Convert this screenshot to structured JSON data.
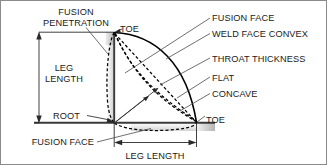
{
  "diagram": {
    "type": "engineering-line-drawing",
    "background_color": "#ffffff",
    "line_color": "#000000",
    "leader_color": "#4a4a4a",
    "shade_color": "#c3c3c3",
    "labels": {
      "fusion_penetration_line1": "FUSION",
      "fusion_penetration_line2": "PENETRATION",
      "leg_length_left_line1": "LEG",
      "leg_length_left_line2": "LENGTH",
      "root": "ROOT",
      "toe_top": "TOE",
      "toe_right": "TOE",
      "fusion_face_right": "FUSION FACE",
      "weld_face_convex": "WELD FACE CONVEX",
      "throat_thickness": "THROAT THICKNESS",
      "flat": "FLAT",
      "concave": "CONCAVE",
      "fusion_face_bottom": "FUSION FACE",
      "leg_length_bottom": "LEG LENGTH"
    },
    "dimensions": [
      {
        "name": "leg-length-vertical",
        "label": "LEG LENGTH",
        "orientation": "vertical"
      },
      {
        "name": "leg-length-horizontal",
        "label": "LEG LENGTH",
        "orientation": "horizontal"
      }
    ],
    "weld_profiles": [
      {
        "name": "convex",
        "style": "solid"
      },
      {
        "name": "flat",
        "style": "dashed"
      },
      {
        "name": "concave",
        "style": "dashed"
      },
      {
        "name": "fusion-penetration",
        "style": "dashed"
      }
    ]
  }
}
